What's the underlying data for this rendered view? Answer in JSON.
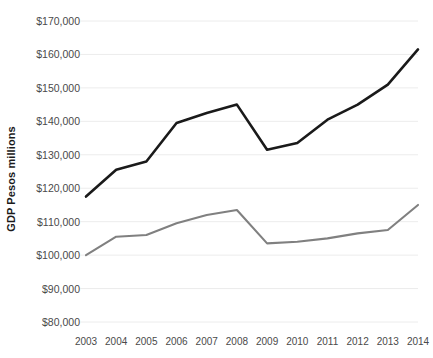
{
  "chart_data": {
    "type": "line",
    "title": "",
    "xlabel": "",
    "ylabel": "GDP Pesos millions",
    "x": [
      2003,
      2004,
      2005,
      2006,
      2007,
      2008,
      2009,
      2010,
      2011,
      2012,
      2013,
      2014
    ],
    "xtick_labels": [
      "2003",
      "2004",
      "2005",
      "2006",
      "2007",
      "2008",
      "2009",
      "2010",
      "2011",
      "2012",
      "2013",
      "2014"
    ],
    "ytick_labels": [
      "$170,000",
      "$160,000",
      "$150,000",
      "$140,000",
      "$130,000",
      "$120,000",
      "$110,000",
      "$100,000",
      "$90,000",
      "$80,000"
    ],
    "ytick_values": [
      170000,
      160000,
      150000,
      140000,
      130000,
      120000,
      110000,
      100000,
      90000,
      80000
    ],
    "ylim": [
      80000,
      170000
    ],
    "grid": true,
    "legend": "none",
    "series": [
      {
        "name": "upper-series",
        "color": "#1a1a1a",
        "width": 2.6,
        "values": [
          117500,
          125500,
          128000,
          139500,
          142500,
          145000,
          131500,
          133500,
          140500,
          145000,
          151000,
          161500
        ]
      },
      {
        "name": "lower-series",
        "color": "#808080",
        "width": 2.1,
        "values": [
          100000,
          105500,
          106000,
          109500,
          112000,
          113500,
          103500,
          104000,
          105000,
          106500,
          107500,
          115000
        ]
      }
    ],
    "grid_color": "#ececec",
    "background": "#ffffff"
  }
}
